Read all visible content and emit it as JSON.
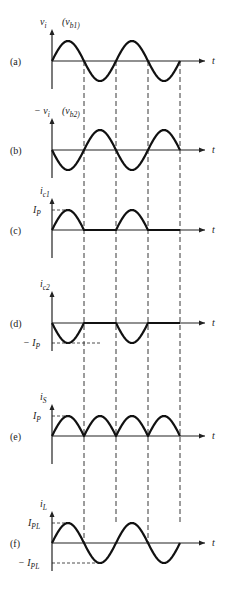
{
  "figure": {
    "time_axis_label": "t",
    "panels": [
      {
        "id": "a",
        "label": "(a)",
        "ylabel": "v_i",
        "ylabel_extra": "(v_b1)",
        "baseline": 61,
        "amp": 20,
        "kind": "sine",
        "levels": []
      },
      {
        "id": "b",
        "label": "(b)",
        "ylabel": "− v_i",
        "ylabel_extra": "(v_b2)",
        "baseline": 150,
        "amp": 20,
        "kind": "neg-sine",
        "levels": []
      },
      {
        "id": "c",
        "label": "(c)",
        "ylabel": "i_c1",
        "baseline": 230,
        "amp": 20,
        "kind": "half-pos",
        "levels": [
          {
            "text": "I_P",
            "value": 1
          }
        ]
      },
      {
        "id": "d",
        "label": "(d)",
        "ylabel": "i_c2",
        "baseline": 323,
        "amp": 20,
        "kind": "half-neg",
        "levels": [
          {
            "text": "− I_P",
            "value": -1
          }
        ]
      },
      {
        "id": "e",
        "label": "(e)",
        "ylabel": "i_S",
        "baseline": 436,
        "amp": 20,
        "kind": "full-rect",
        "levels": [
          {
            "text": "I_P",
            "value": 1
          }
        ]
      },
      {
        "id": "f",
        "label": "(f)",
        "ylabel": "i_L",
        "baseline": 543,
        "amp": 20,
        "kind": "sine",
        "levels": [
          {
            "text": "I_PL",
            "value": 1
          },
          {
            "text": "− I_PL",
            "value": -1
          }
        ]
      }
    ],
    "dashed_verticals_x": [
      84,
      116,
      148,
      180
    ],
    "axis_x": 52,
    "x_end": 205,
    "half_period_px": 32,
    "half_cycles": 4
  }
}
